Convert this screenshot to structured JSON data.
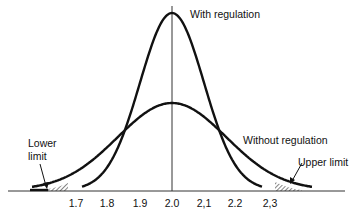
{
  "chart_data": {
    "type": "line",
    "title": "",
    "xlabel": "",
    "ylabel": "",
    "x_ticks": [
      "1.7",
      "1.8",
      "1.9",
      "2.0",
      "2,1",
      "2.2",
      "2,3"
    ],
    "xlim": [
      1.5,
      2.5
    ],
    "grid": false,
    "legend": "none",
    "series": [
      {
        "name": "With regulation",
        "distribution": "normal",
        "mean": 2.0,
        "sd": 0.1,
        "relative_peak": 1.0,
        "x_range": [
          1.72,
          2.28
        ]
      },
      {
        "name": "Without regulation",
        "distribution": "normal",
        "mean": 2.0,
        "sd": 0.17,
        "relative_peak": 0.5,
        "x_range": [
          1.5,
          2.5
        ]
      }
    ],
    "annotations": [
      {
        "text": "With regulation",
        "target": "narrow curve peak"
      },
      {
        "text": "Without regulation",
        "target": "wide curve"
      },
      {
        "text": "Lower limit",
        "target": "shaded left tail below 1.7"
      },
      {
        "text": "Upper limit",
        "target": "shaded right tail above 2.3"
      }
    ],
    "center_line": 2.0,
    "shaded_regions": [
      [
        1.62,
        1.7
      ],
      [
        2.3,
        2.4
      ]
    ]
  },
  "labels": {
    "with_regulation": "With regulation",
    "without_regulation": "Without regulation",
    "lower_limit_line1": "Lower",
    "lower_limit_line2": "limit",
    "upper_limit": "Upper limit"
  },
  "ticks": [
    "1.7",
    "1.8",
    "1.9",
    "2.0",
    "2,1",
    "2.2",
    "2,3"
  ]
}
